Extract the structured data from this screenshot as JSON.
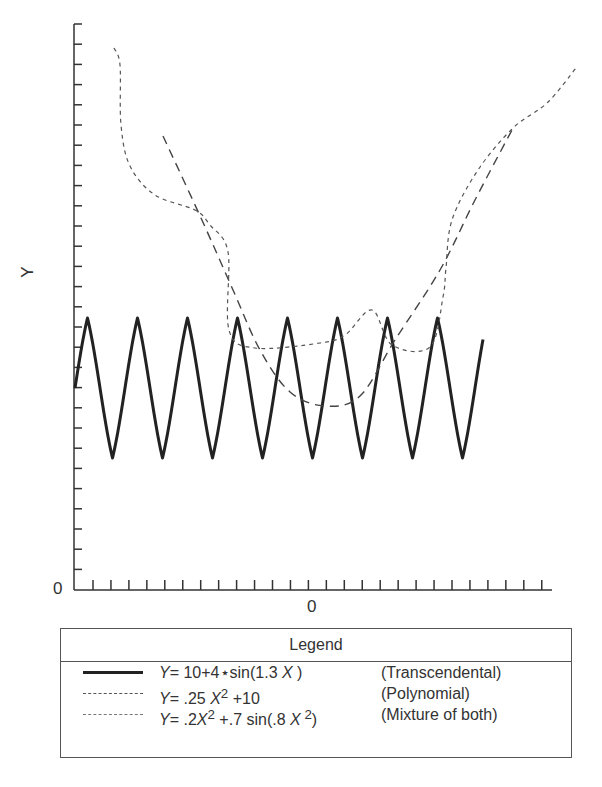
{
  "chart_data": {
    "type": "line",
    "title": "",
    "xlabel": "",
    "ylabel": "Y",
    "x_tick_labels": [
      {
        "position": "origin",
        "label": "0"
      },
      {
        "position": "center",
        "label": "0"
      }
    ],
    "y_tick_labels": [
      {
        "position": "origin",
        "label": "0"
      }
    ],
    "grid": false,
    "legend_position": "below",
    "legend_title": "Legend",
    "series": [
      {
        "name": "Y= 10+4*sin(1.3 X)",
        "description": "(Transcendental)",
        "style": "solid",
        "formula": "10 + 4*sin(1.3*X)",
        "shape": "sinusoid, 8 peaks, oscillating between approx 6 and 14"
      },
      {
        "name": "Y= .25 X^2 +10",
        "description": "(Polynomial)",
        "style": "dashed",
        "formula": "0.25*X^2 + 10",
        "shape": "parabola with minimum near X=0"
      },
      {
        "name": "Y= .2X^2 +.7 sin(.8 X^2)",
        "description": "(Mixture of both)",
        "style": "dotted",
        "formula": "0.2*X^2 + 0.7*sin(0.8*X^2)",
        "shape": "irregular parabola-like curve with oscillations"
      }
    ],
    "pixel_paths": {
      "transcendental": {
        "start": [
          75,
          388
        ],
        "end": [
          483,
          388
        ],
        "peak_y": 318,
        "trough_y": 458,
        "period_px": 50
      },
      "polynomial": [
        [
          163,
          136
        ],
        [
          201,
          218
        ],
        [
          233,
          290
        ],
        [
          260,
          350
        ],
        [
          290,
          392
        ],
        [
          325,
          406
        ],
        [
          360,
          396
        ],
        [
          395,
          340
        ],
        [
          440,
          270
        ],
        [
          475,
          200
        ],
        [
          513,
          128
        ]
      ],
      "mixture": [
        [
          114,
          48
        ],
        [
          120,
          65
        ],
        [
          121,
          125
        ],
        [
          130,
          166
        ],
        [
          155,
          195
        ],
        [
          195,
          210
        ],
        [
          210,
          225
        ],
        [
          228,
          252
        ],
        [
          229,
          330
        ],
        [
          255,
          348
        ],
        [
          320,
          343
        ],
        [
          345,
          335
        ],
        [
          372,
          310
        ],
        [
          392,
          345
        ],
        [
          430,
          347
        ],
        [
          443,
          297
        ],
        [
          446,
          268
        ],
        [
          452,
          220
        ],
        [
          478,
          170
        ],
        [
          513,
          128
        ],
        [
          547,
          103
        ],
        [
          576,
          68
        ]
      ]
    }
  },
  "axes": {
    "y_label": "Y",
    "y_origin_label": "0",
    "x_center_label": "0"
  },
  "legend": {
    "title": "Legend",
    "rows": [
      {
        "eq_prefix": "Y",
        "eq_rest": "= 10+4⋆sin(1.3 ",
        "eq_var": "X",
        "eq_close": " )",
        "desc": "(Transcendental)"
      },
      {
        "eq_prefix": "Y",
        "eq_rest": "= .25 ",
        "eq_var": "X",
        "eq_sup": "2",
        "eq_close": " +10",
        "desc": "(Polynomial)"
      },
      {
        "eq_prefix": "Y",
        "eq_rest": "= .2",
        "eq_var": "X",
        "eq_sup": "2",
        "eq_mid": " +.7  sin(.8 ",
        "eq_var2": "X",
        "eq_sup2": " 2",
        "eq_close": ")",
        "desc": "(Mixture of both)"
      }
    ]
  }
}
